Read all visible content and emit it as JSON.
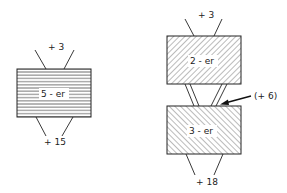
{
  "diagram": {
    "left": {
      "box_label": "5 - er",
      "input_label": "+ 3",
      "output_label": "+ 15",
      "fill_pattern": "horizontal-lines"
    },
    "right": {
      "top_box_label": "2 - er",
      "bottom_box_label": "3 - er",
      "input_label": "+ 3",
      "intermediate_label": "(+ 6)",
      "output_label": "+ 18",
      "fill_pattern_top": "diagonal-forward",
      "fill_pattern_bottom": "diagonal-backward"
    }
  },
  "colors": {
    "stroke": "#222222",
    "hatch": "#555555",
    "background": "#ffffff"
  }
}
